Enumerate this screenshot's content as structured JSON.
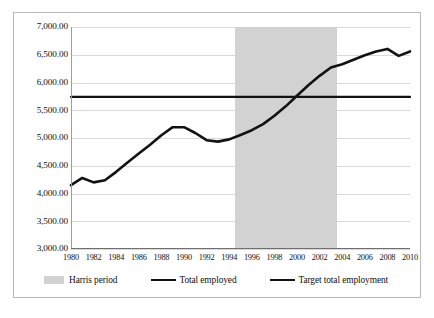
{
  "chart_data": {
    "type": "line",
    "title": "",
    "xlabel": "",
    "ylabel": "",
    "xlim": [
      1980,
      2010
    ],
    "ylim": [
      3000,
      7000
    ],
    "grid": true,
    "legend_position": "bottom",
    "y_ticks": [
      "3,000.00",
      "3,500.00",
      "4,000.00",
      "4,500.00",
      "5,000.00",
      "5,500.00",
      "6,000.00",
      "6,500.00",
      "7,000.00"
    ],
    "y_tick_values": [
      3000,
      3500,
      4000,
      4500,
      5000,
      5500,
      6000,
      6500,
      7000
    ],
    "x_ticks": [
      "1980",
      "1982",
      "1984",
      "1986",
      "1988",
      "1990",
      "1992",
      "1994",
      "1996",
      "1998",
      "2000",
      "2002",
      "2004",
      "2006",
      "2008",
      "2010"
    ],
    "x_tick_values": [
      1980,
      1982,
      1984,
      1986,
      1988,
      1990,
      1992,
      1994,
      1996,
      1998,
      2000,
      2002,
      2004,
      2006,
      2008,
      2010
    ],
    "x": [
      1980,
      1981,
      1982,
      1983,
      1984,
      1985,
      1986,
      1987,
      1988,
      1989,
      1990,
      1991,
      1992,
      1993,
      1994,
      1995,
      1996,
      1997,
      1998,
      1999,
      2000,
      2001,
      2002,
      2003,
      2004,
      2005,
      2006,
      2007,
      2008,
      2009,
      2010
    ],
    "series": [
      {
        "name": "Total employed",
        "color": "#121212",
        "values": [
          4150,
          4280,
          4200,
          4240,
          4390,
          4560,
          4720,
          4880,
          5050,
          5195,
          5195,
          5090,
          4960,
          4935,
          4975,
          5055,
          5140,
          5250,
          5400,
          5570,
          5760,
          5950,
          6120,
          6270,
          6330,
          6410,
          6490,
          6560,
          6605,
          6480,
          6560
        ]
      },
      {
        "name": "Target total employment",
        "color": "#121212",
        "values": [
          5740,
          5740,
          5740,
          5740,
          5740,
          5740,
          5740,
          5740,
          5740,
          5740,
          5740,
          5740,
          5740,
          5740,
          5740,
          5740,
          5740,
          5740,
          5740,
          5740,
          5740,
          5740,
          5740,
          5740,
          5740,
          5740,
          5740,
          5740,
          5740,
          5740,
          5740
        ]
      }
    ],
    "shaded_region": {
      "name": "Harris period",
      "color": "#d2d2d2",
      "x_start": 1994.5,
      "x_end": 2003.5
    }
  },
  "legend": {
    "items": [
      {
        "label": "Harris period",
        "marker": "swatch"
      },
      {
        "label": "Total employed",
        "marker": "line"
      },
      {
        "label": "Target total employment",
        "marker": "line"
      }
    ]
  }
}
